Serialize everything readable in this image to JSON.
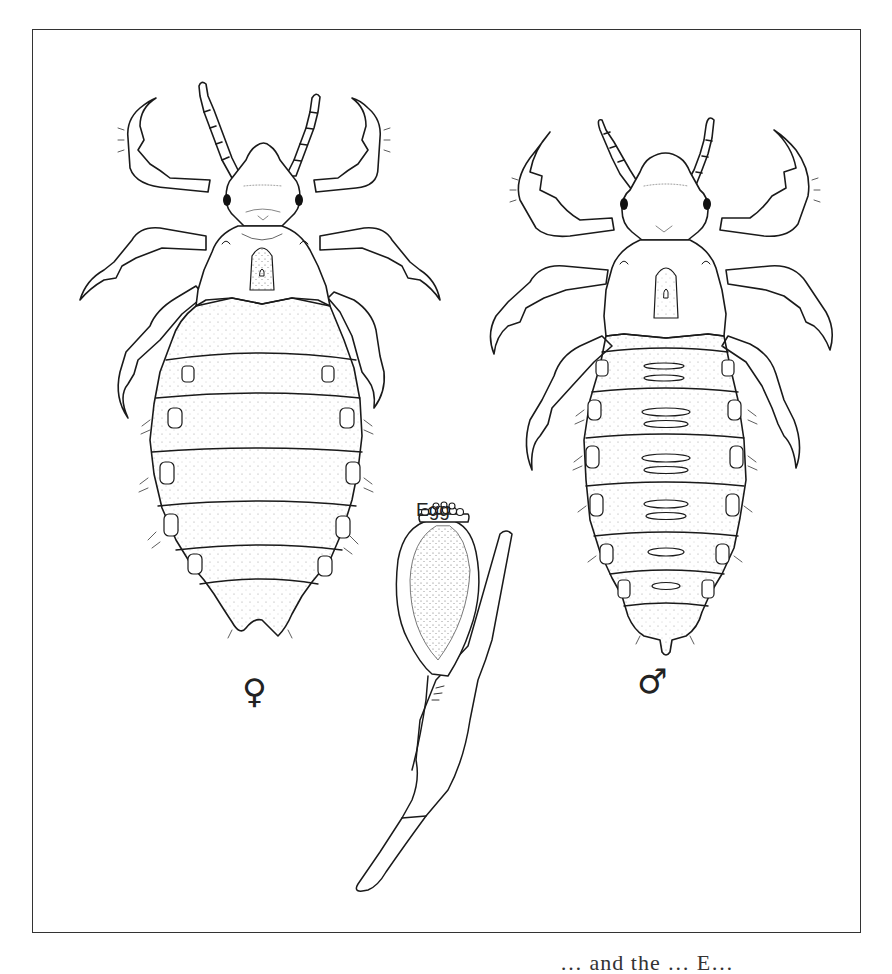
{
  "figure": {
    "subjects": [
      {
        "id": "female",
        "label": "♀",
        "description": "female louse, dorsal view"
      },
      {
        "id": "egg",
        "label": "Egg",
        "description": "egg (nit) cemented to a hair shaft"
      },
      {
        "id": "male",
        "label": "♂",
        "description": "male louse, dorsal view"
      }
    ],
    "labels": {
      "female_symbol": "♀",
      "egg": "Egg",
      "male_symbol": "♂"
    },
    "caption_partial": "… and the … E…"
  },
  "colors": {
    "ink": "#1a1a1a",
    "stipple": "#555555",
    "background": "#ffffff",
    "frame": "#333333"
  }
}
